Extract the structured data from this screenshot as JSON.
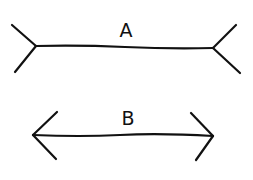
{
  "figure": {
    "type": "muller-lyer-illusion",
    "background": "#ffffff",
    "ink_color": "#111111"
  },
  "lines": [
    {
      "label": "A",
      "fin_style": "outward-tails",
      "shaft": {
        "x1": 36,
        "y1": 46,
        "x2": 213,
        "y2": 48
      },
      "label_pos": {
        "x": 126,
        "y": 37
      }
    },
    {
      "label": "B",
      "fin_style": "arrowheads",
      "shaft": {
        "x1": 33,
        "y1": 135,
        "x2": 213,
        "y2": 136
      },
      "label_pos": {
        "x": 128,
        "y": 125
      }
    }
  ]
}
